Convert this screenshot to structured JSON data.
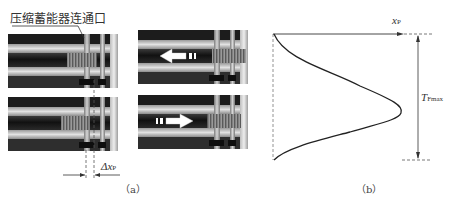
{
  "figure": {
    "panel_a": {
      "callout_label": "压缩蓄能器连通口",
      "displacement_label": "Δx",
      "displacement_sub": "P",
      "caption": "（a）"
    },
    "panel_b": {
      "x_axis_label": "x",
      "x_axis_sub": "P",
      "magnitude_label": "T",
      "magnitude_sub": "Fmax",
      "caption": "（b）",
      "top_panel_arrow_direction": "left",
      "bottom_panel_arrow_direction": "right"
    },
    "colors": {
      "background": "#ffffff",
      "cylinder_dark": "#1e1e1e",
      "cylinder_mid": "#8a8a8a",
      "cylinder_light": "#cfcfcf",
      "curve": "#222222",
      "dashed": "#777777",
      "arrow_fill": "#ffffff"
    }
  }
}
